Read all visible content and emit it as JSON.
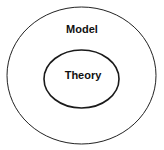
{
  "diagram": {
    "type": "nested-sets",
    "outer": {
      "label": "Model",
      "stroke": "#222222"
    },
    "inner": {
      "label": "Theory",
      "stroke": "#1a1a1a"
    }
  }
}
